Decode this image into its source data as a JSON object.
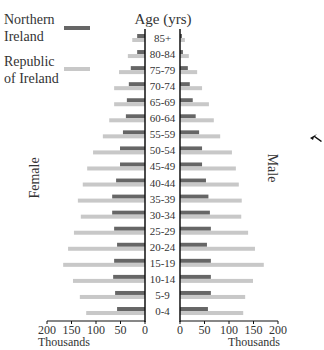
{
  "chart_data": {
    "type": "bar",
    "subtype": "population-pyramid",
    "title": "Age (yrs)",
    "categories": [
      "85+",
      "80-84",
      "75-79",
      "70-74",
      "65-69",
      "60-64",
      "55-59",
      "50-54",
      "45-49",
      "40-44",
      "35-39",
      "30-34",
      "25-29",
      "20-24",
      "15-19",
      "10-14",
      "5-9",
      "0-4"
    ],
    "series": [
      {
        "name": "Northern Ireland",
        "color": "#666666",
        "female": [
          16,
          16,
          29,
          33,
          37,
          39,
          45,
          51,
          51,
          59,
          67,
          67,
          63,
          57,
          63,
          65,
          61,
          57
        ],
        "male": [
          4,
          6,
          16,
          20,
          26,
          32,
          39,
          45,
          45,
          53,
          58,
          61,
          63,
          55,
          63,
          63,
          63,
          57
        ]
      },
      {
        "name": "Republic of Ireland",
        "color": "#c8c8c8",
        "female": [
          26,
          35,
          53,
          63,
          63,
          73,
          86,
          106,
          118,
          127,
          137,
          131,
          145,
          157,
          167,
          147,
          133,
          120
        ],
        "male": [
          10,
          18,
          35,
          45,
          59,
          69,
          82,
          106,
          114,
          120,
          126,
          125,
          139,
          153,
          171,
          149,
          133,
          129
        ]
      }
    ],
    "left_label": "Female",
    "right_label": "Male",
    "xlabel_left": "Thousands",
    "xlabel_right": "Thousands",
    "xlim": [
      0,
      200
    ],
    "xticks_left": [
      "200",
      "150",
      "100",
      "50",
      "0"
    ],
    "xticks_right": [
      "0",
      "50",
      "100",
      "150",
      "200"
    ],
    "xtick_values": [
      0,
      50,
      100,
      150,
      200
    ],
    "legend": [
      "Northern Ireland",
      "Republic of Ireland"
    ],
    "legend_lines": [
      [
        "Northern",
        "Ireland"
      ],
      [
        "Republic",
        "of Ireland"
      ]
    ],
    "legend_position": "top-left",
    "grid": false
  },
  "cursor": {
    "icon": "mouse-pointer-icon"
  }
}
